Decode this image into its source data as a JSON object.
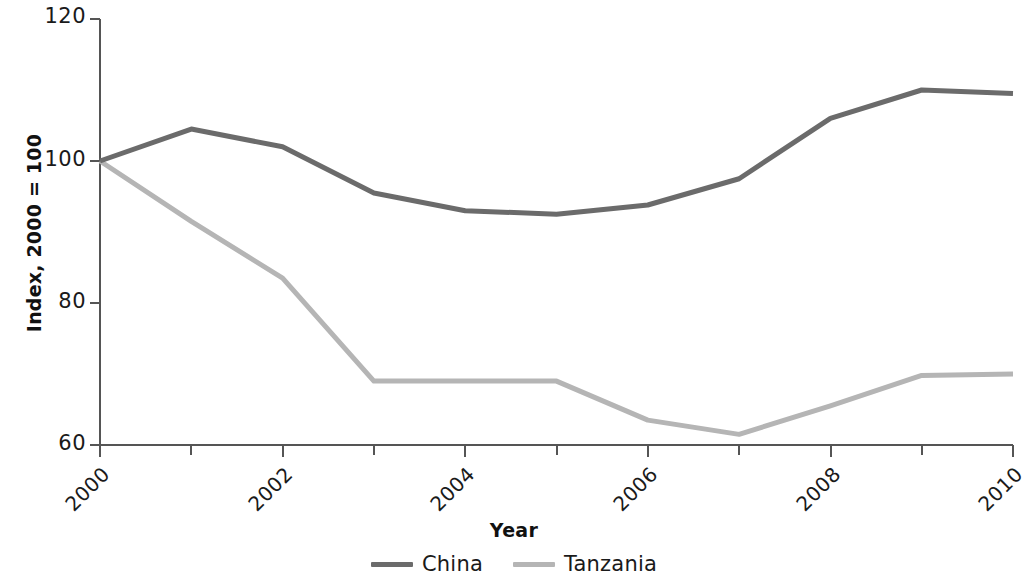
{
  "chart_data": {
    "type": "line",
    "title": "",
    "xlabel": "Year",
    "ylabel": "Index, 2000 = 100",
    "x": [
      2000,
      2001,
      2002,
      2003,
      2004,
      2005,
      2006,
      2007,
      2008,
      2009,
      2010
    ],
    "categories": [
      "2000",
      "2001",
      "2002",
      "2003",
      "2004",
      "2005",
      "2006",
      "2007",
      "2008",
      "2009",
      "2010"
    ],
    "series": [
      {
        "name": "China",
        "color": "#6b6b6b",
        "values": [
          100,
          104.5,
          102,
          95.5,
          93,
          92.5,
          93.8,
          97.5,
          106,
          110,
          109.5
        ]
      },
      {
        "name": "Tanzania",
        "color": "#b5b5b5",
        "values": [
          100,
          91.5,
          83.5,
          69,
          69,
          69,
          63.5,
          61.5,
          65.5,
          69.8,
          70
        ]
      }
    ],
    "xlim": [
      2000,
      2010
    ],
    "ylim": [
      60,
      120
    ],
    "y_ticks": [
      60,
      80,
      100,
      120
    ],
    "y_tick_labels": [
      "60",
      "80",
      "100",
      "120"
    ],
    "x_ticks": [
      2000,
      2001,
      2002,
      2003,
      2004,
      2005,
      2006,
      2007,
      2008,
      2009,
      2010
    ],
    "x_tick_labels_shown": [
      "2000",
      "2002",
      "2004",
      "2006",
      "2008",
      "2010"
    ],
    "x_tick_label_rotation": -45,
    "grid": false,
    "legend_position": "bottom-center",
    "axis_color": "#555555"
  },
  "legend": {
    "entries": [
      {
        "label": "China",
        "color": "#6b6b6b"
      },
      {
        "label": "Tanzania",
        "color": "#b5b5b5"
      }
    ]
  },
  "axes": {
    "y_title": "Index, 2000 = 100",
    "x_title": "Year",
    "y_tick_0": "120",
    "y_tick_1": "100",
    "y_tick_2": "80",
    "y_tick_3": "60",
    "x_tick_0": "2000",
    "x_tick_1": "2002",
    "x_tick_2": "2004",
    "x_tick_3": "2006",
    "x_tick_4": "2008",
    "x_tick_5": "2010"
  }
}
